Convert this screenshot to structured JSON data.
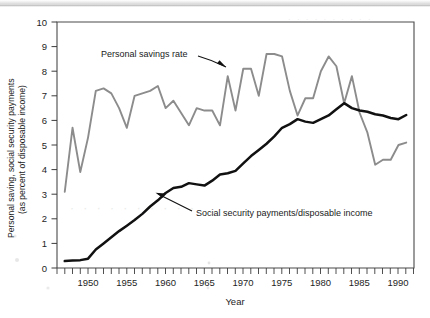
{
  "figure": {
    "y_axis_title_line1": "Personal saving, social security payments",
    "y_axis_title_line2": "(as percent of disposable income)",
    "x_axis_title": "Year",
    "annotation_savings": "Personal savings rate",
    "annotation_ss": "Social security payments/disposable income",
    "colors": {
      "savings_line": "#8c8c8c",
      "social_security_line": "#111111",
      "axis": "#4a4a4a",
      "background": "#ffffff"
    }
  },
  "chart_data": {
    "type": "line",
    "title": "",
    "subtitle": "",
    "xlabel": "Year",
    "ylabel": "Personal saving, social security payments (as percent of disposable income)",
    "xlim": [
      1946,
      1992
    ],
    "ylim": [
      0,
      10
    ],
    "xtick_labels": [
      "1950",
      "1955",
      "1960",
      "1965",
      "1970",
      "1975",
      "1980",
      "1985",
      "1990"
    ],
    "xticks": [
      1950,
      1955,
      1960,
      1965,
      1970,
      1975,
      1980,
      1985,
      1990
    ],
    "xtick_minor_step": 1,
    "ytick_labels": [
      "0",
      "1",
      "2",
      "3",
      "4",
      "5",
      "6",
      "7",
      "8",
      "9",
      "10"
    ],
    "yticks": [
      0,
      1,
      2,
      3,
      4,
      5,
      6,
      7,
      8,
      9,
      10
    ],
    "grid": false,
    "legend": "annotations-with-arrows",
    "annotations": [
      {
        "text": "Personal savings rate",
        "text_xy": [
          1952.0,
          8.45
        ],
        "points_to_xy": [
          1962.6,
          7.85
        ],
        "series": "Personal savings rate"
      },
      {
        "text": "Social security payments/disposable income",
        "text_xy": [
          1964.0,
          2.55
        ],
        "points_to_xy": [
          1958.3,
          3.45
        ],
        "series": "Social security payments/disposable income"
      }
    ],
    "x": [
      1947,
      1948,
      1949,
      1950,
      1951,
      1952,
      1953,
      1954,
      1955,
      1956,
      1957,
      1958,
      1959,
      1960,
      1961,
      1962,
      1963,
      1964,
      1965,
      1966,
      1967,
      1968,
      1969,
      1970,
      1971,
      1972,
      1973,
      1974,
      1975,
      1976,
      1977,
      1978,
      1979,
      1980,
      1981,
      1982,
      1983,
      1984,
      1985,
      1986,
      1987,
      1988,
      1989,
      1990,
      1991
    ],
    "series": [
      {
        "name": "Personal savings rate",
        "color": "#8c8c8c",
        "values": [
          3.1,
          5.7,
          3.9,
          5.3,
          7.2,
          7.3,
          7.1,
          6.5,
          5.7,
          7.0,
          7.1,
          7.2,
          7.4,
          6.5,
          6.8,
          6.3,
          5.8,
          6.5,
          6.4,
          6.4,
          5.8,
          7.8,
          6.4,
          8.1,
          8.1,
          7.0,
          8.7,
          8.7,
          8.6,
          7.2,
          6.2,
          6.9,
          6.9,
          8.0,
          8.6,
          8.2,
          6.7,
          7.8,
          6.3,
          5.5,
          4.2,
          4.4,
          4.4,
          5.0,
          5.1
        ]
      },
      {
        "name": "Social security payments/disposable income",
        "color": "#111111",
        "values": [
          0.28,
          0.3,
          0.32,
          0.38,
          0.75,
          1.0,
          1.25,
          1.5,
          1.72,
          1.95,
          2.2,
          2.5,
          2.75,
          3.05,
          3.25,
          3.3,
          3.45,
          3.4,
          3.35,
          3.55,
          3.8,
          3.85,
          3.95,
          4.25,
          4.55,
          4.8,
          5.05,
          5.35,
          5.7,
          5.85,
          6.05,
          5.95,
          5.9,
          6.05,
          6.2,
          6.45,
          6.7,
          6.5,
          6.4,
          6.35,
          6.25,
          6.2,
          6.1,
          6.05,
          6.22
        ]
      }
    ]
  }
}
